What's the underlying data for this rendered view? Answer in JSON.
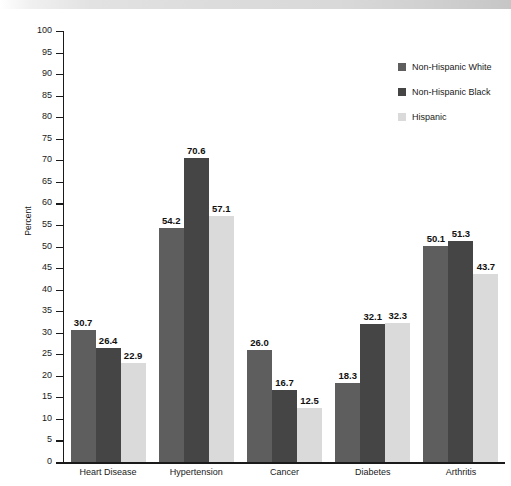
{
  "chart_data": {
    "type": "bar",
    "title": "",
    "xlabel": "",
    "ylabel": "Percent",
    "ylim": [
      0,
      100
    ],
    "ytick_step": 5,
    "grid": false,
    "legend_position": "top-right",
    "categories": [
      "Heart Disease",
      "Hypertension",
      "Cancer",
      "Diabetes",
      "Arthritis"
    ],
    "series": [
      {
        "name": "Non-Hispanic White",
        "color": "#5e5e5e",
        "values": [
          30.7,
          54.2,
          26.0,
          18.3,
          50.1
        ],
        "labels": [
          "30.7",
          "54.2",
          "26.0",
          "18.3",
          "50.1"
        ]
      },
      {
        "name": "Non-Hispanic Black",
        "color": "#454545",
        "values": [
          26.4,
          70.6,
          16.7,
          32.1,
          51.3
        ],
        "labels": [
          "26.4",
          "70.6",
          "16.7",
          "32.1",
          "51.3"
        ]
      },
      {
        "name": "Hispanic",
        "color": "#dadada",
        "values": [
          22.9,
          57.1,
          12.5,
          32.3,
          43.7
        ],
        "labels": [
          "22.9",
          "57.1",
          "12.5",
          "32.3",
          "43.7"
        ]
      }
    ],
    "ytick_labels": [
      "100",
      "95",
      "90",
      "85",
      "80",
      "75",
      "70",
      "65",
      "60",
      "55",
      "50",
      "45",
      "40",
      "35",
      "30",
      "25",
      "20",
      "15",
      "10",
      "5",
      "0"
    ],
    "ytick_values": [
      100,
      95,
      90,
      85,
      80,
      75,
      70,
      65,
      60,
      55,
      50,
      45,
      40,
      35,
      30,
      25,
      20,
      15,
      10,
      5,
      0
    ]
  },
  "legend": {
    "items": [
      {
        "label": "Non-Hispanic White"
      },
      {
        "label": "Non-Hispanic Black"
      },
      {
        "label": "Hispanic"
      }
    ]
  }
}
